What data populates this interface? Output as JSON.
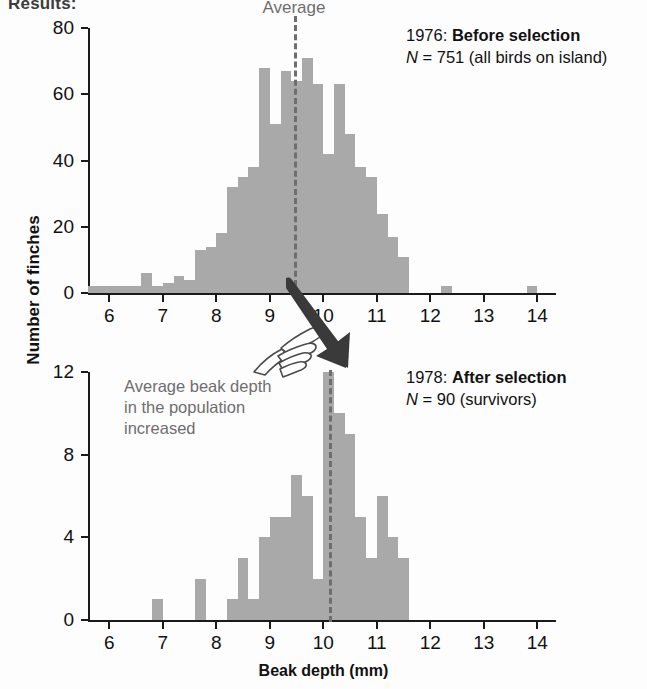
{
  "figure": {
    "title": "Results:",
    "y_axis_label": "Number of finches",
    "x_axis_label": "Beak depth (mm)",
    "bar_color": "#a9a9a9",
    "annotation_color": "#6e6e6e",
    "axis_color": "#1a1a1a"
  },
  "callout": {
    "text": "Average beak depth in the population increased",
    "hand_icon": "pointing-hand-icon",
    "arrow_icon": "arrow-down-right-icon"
  },
  "chart_data": [
    {
      "type": "bar",
      "title": "1976: Before selection",
      "year": "1976",
      "condition": "Before selection",
      "n_label": "N = 751 (all birds on island)",
      "n_symbol": "N",
      "n_value": "751",
      "n_detail": "(all birds on island)",
      "xlabel": "Beak depth (mm)",
      "ylabel": "Number of finches",
      "xlim": [
        5.6,
        14.2
      ],
      "ylim": [
        0,
        80
      ],
      "yticks": [
        0,
        20,
        40,
        60,
        80
      ],
      "xticks": [
        6,
        7,
        8,
        9,
        10,
        11,
        12,
        13,
        14
      ],
      "bin_width": 0.2,
      "grid": false,
      "average_line": {
        "label": "Average",
        "value": 9.45
      },
      "bins": [
        5.7,
        5.9,
        6.1,
        6.3,
        6.5,
        6.7,
        6.9,
        7.1,
        7.3,
        7.5,
        7.7,
        7.9,
        8.1,
        8.3,
        8.5,
        8.7,
        8.9,
        9.1,
        9.3,
        9.5,
        9.7,
        9.9,
        10.1,
        10.3,
        10.5,
        10.7,
        10.9,
        11.1,
        11.3,
        11.5,
        12.3,
        13.9
      ],
      "values": [
        2,
        2,
        2,
        2,
        2,
        6,
        2,
        3,
        5,
        4,
        13,
        14,
        18,
        32,
        35,
        38,
        68,
        51,
        67,
        64,
        71,
        63,
        42,
        63,
        48,
        38,
        35,
        24,
        17,
        11,
        2,
        2
      ]
    },
    {
      "type": "bar",
      "title": "1978: After selection",
      "year": "1978",
      "condition": "After selection",
      "n_label": "N = 90 (survivors)",
      "n_symbol": "N",
      "n_value": "90",
      "n_detail": "(survivors)",
      "xlabel": "Beak depth (mm)",
      "ylabel": "Number of finches",
      "xlim": [
        5.6,
        14.2
      ],
      "ylim": [
        0,
        12
      ],
      "yticks": [
        0,
        4,
        8,
        12
      ],
      "xticks": [
        6,
        7,
        8,
        9,
        10,
        11,
        12,
        13,
        14
      ],
      "bin_width": 0.2,
      "grid": false,
      "average_line": {
        "label": "",
        "value": 10.1
      },
      "bins": [
        6.9,
        7.7,
        8.3,
        8.5,
        8.7,
        8.9,
        9.1,
        9.3,
        9.5,
        9.7,
        9.9,
        10.1,
        10.3,
        10.5,
        10.7,
        10.9,
        11.1,
        11.3,
        11.5
      ],
      "values": [
        1,
        2,
        1,
        3,
        1,
        4,
        5,
        5,
        7,
        6,
        2,
        12,
        10,
        9,
        5,
        3,
        6,
        4,
        3
      ]
    }
  ]
}
